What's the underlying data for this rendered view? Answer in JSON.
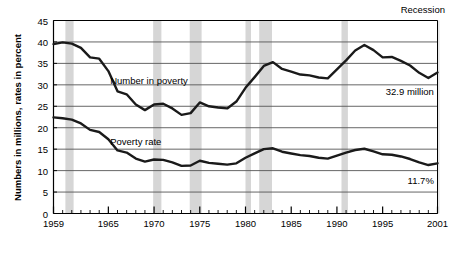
{
  "chart_data": {
    "type": "line",
    "title": "",
    "xlabel": "",
    "ylabel": "Numbers in millions, rates in percent",
    "xlim": [
      1959,
      2001
    ],
    "ylim": [
      0,
      45
    ],
    "grid": true,
    "legend_position": "inline-annotation",
    "y_ticks": [
      0,
      5,
      10,
      15,
      20,
      25,
      30,
      35,
      40,
      45
    ],
    "x_ticks_labeled": [
      1959,
      1965,
      1970,
      1975,
      1980,
      1985,
      1990,
      1995,
      2001
    ],
    "x_ticks_minor_every": 1,
    "x": [
      1959,
      1960,
      1961,
      1962,
      1963,
      1964,
      1965,
      1966,
      1967,
      1968,
      1969,
      1970,
      1971,
      1972,
      1973,
      1974,
      1975,
      1976,
      1977,
      1978,
      1979,
      1980,
      1981,
      1982,
      1983,
      1984,
      1985,
      1986,
      1987,
      1988,
      1989,
      1990,
      1991,
      1992,
      1993,
      1994,
      1995,
      1996,
      1997,
      1998,
      1999,
      2000,
      2001
    ],
    "series": [
      {
        "name": "Number in poverty",
        "units": "millions",
        "label_text": "Number in poverty",
        "end_label": "32.9 million",
        "color": "#1a1a1a",
        "values": [
          39.5,
          39.9,
          39.6,
          38.6,
          36.4,
          36.1,
          33.2,
          28.5,
          27.8,
          25.4,
          24.1,
          25.4,
          25.6,
          24.5,
          23.0,
          23.4,
          25.9,
          25.0,
          24.7,
          24.5,
          26.1,
          29.3,
          31.8,
          34.4,
          35.3,
          33.7,
          33.1,
          32.4,
          32.2,
          31.7,
          31.5,
          33.6,
          35.7,
          38.0,
          39.3,
          38.1,
          36.4,
          36.5,
          35.6,
          34.5,
          32.8,
          31.6,
          32.9
        ]
      },
      {
        "name": "Poverty rate",
        "units": "percent",
        "label_text": "Poverty rate",
        "end_label": "11.7%",
        "color": "#1a1a1a",
        "values": [
          22.4,
          22.2,
          21.9,
          21.0,
          19.5,
          19.0,
          17.3,
          14.7,
          14.2,
          12.8,
          12.1,
          12.6,
          12.5,
          11.9,
          11.1,
          11.2,
          12.3,
          11.8,
          11.6,
          11.4,
          11.7,
          13.0,
          14.0,
          15.0,
          15.2,
          14.4,
          14.0,
          13.6,
          13.4,
          13.0,
          12.8,
          13.5,
          14.2,
          14.8,
          15.1,
          14.5,
          13.8,
          13.7,
          13.3,
          12.7,
          11.9,
          11.3,
          11.7
        ]
      }
    ],
    "recession_label": "Recession",
    "recession_bands": [
      {
        "start": 1960.3,
        "end": 1961.2
      },
      {
        "start": 1969.9,
        "end": 1970.8
      },
      {
        "start": 1973.9,
        "end": 1975.2
      },
      {
        "start": 1980.0,
        "end": 1980.6
      },
      {
        "start": 1981.5,
        "end": 1982.9
      },
      {
        "start": 1990.5,
        "end": 1991.2
      },
      {
        "start": 2001.1,
        "end": 2001.6
      }
    ],
    "colors": {
      "recession_band": "#d6d6d6",
      "gridline": "#555555",
      "axis": "#000000",
      "line": "#1a1a1a",
      "background": "#ffffff",
      "text": "#000000"
    }
  }
}
